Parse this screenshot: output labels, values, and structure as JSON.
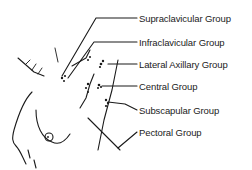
{
  "diagram": {
    "labels": [
      {
        "id": "supraclavicular",
        "text": "Supraclavicular Group",
        "x": 137,
        "y": 10
      },
      {
        "id": "infraclavicular",
        "text": "Infraclavicular Group",
        "x": 137,
        "y": 34
      },
      {
        "id": "lateral-axillary",
        "text": "Lateral Axillary Group",
        "x": 137,
        "y": 56
      },
      {
        "id": "central",
        "text": "Central Group",
        "x": 137,
        "y": 78
      },
      {
        "id": "subscapular",
        "text": "Subscapular Group",
        "x": 137,
        "y": 103
      },
      {
        "id": "pectoral",
        "text": "Pectoral Group",
        "x": 137,
        "y": 125
      }
    ],
    "colors": {
      "line": "#1a1a1a",
      "text": "#222222",
      "background": "#ffffff"
    }
  }
}
